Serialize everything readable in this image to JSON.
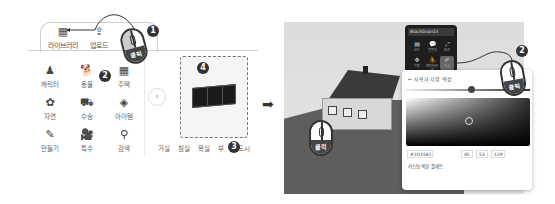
{
  "left_panel": {
    "tabs": [
      {
        "label": "라이브러리",
        "icon": "library-icon"
      },
      {
        "label": "업로드",
        "icon": "upload-icon"
      }
    ],
    "categories": [
      {
        "label": "캐릭터",
        "icon": "character-icon",
        "glyph": "♟"
      },
      {
        "label": "동물",
        "icon": "dog-icon",
        "glyph": "🐕"
      },
      {
        "label": "주택",
        "icon": "building-icon",
        "glyph": "▦"
      },
      {
        "label": "자연",
        "icon": "flower-icon",
        "glyph": "✿"
      },
      {
        "label": "수송",
        "icon": "car-icon",
        "glyph": "⛟"
      },
      {
        "label": "아이템",
        "icon": "gem-icon",
        "glyph": "◈"
      },
      {
        "label": "만들기",
        "icon": "shapes-icon",
        "glyph": "✎"
      },
      {
        "label": "특수",
        "icon": "camera-icon",
        "glyph": "🎥"
      },
      {
        "label": "검색",
        "icon": "search-icon",
        "glyph": "⚲"
      }
    ],
    "subcategories": [
      "거실",
      "침실",
      "욕실",
      "부",
      "도시"
    ],
    "prev_glyph": "‹",
    "library_glyph": "▦",
    "upload_glyph": "⇪"
  },
  "badges": {
    "one": "1",
    "two": "2",
    "three": "3",
    "four": "4",
    "two_right": "2"
  },
  "mouse_label": "클릭",
  "arrow_glyph": "➡",
  "context_menu": {
    "title": "Blackboard3",
    "items": [
      {
        "label": "코드",
        "glyph": "▤"
      },
      {
        "label": "말풍선",
        "glyph": "💬"
      },
      {
        "label": "효과",
        "glyph": "⤢"
      },
      {
        "label": "이동",
        "glyph": "✥"
      },
      {
        "label": "캐릭터 설정",
        "glyph": "⛹"
      },
      {
        "label": "색상",
        "glyph": "✐"
      }
    ]
  },
  "color_panel": {
    "back_label": "←  사용자 지정 색상",
    "hex_label": "HEX",
    "hex_value": "#2D3581",
    "r_label": "R",
    "r_value": "45",
    "g_label": "G",
    "g_value": "53",
    "b_label": "B",
    "b_value": "129",
    "custom_palette_label": "커스텀 색상 팔레트"
  }
}
